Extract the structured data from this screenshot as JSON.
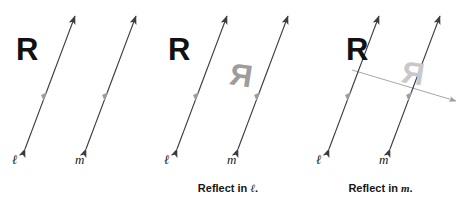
{
  "figure": {
    "background_color": "#ffffff",
    "width": 457,
    "height": 198
  },
  "colors": {
    "line_dark": "#3a3a42",
    "line_gray": "#9d9d9d",
    "glyph_black": "#111111",
    "glyph_gray": "#9d9d9d",
    "glyph_faint": "#c9c9c9",
    "text": "#161616"
  },
  "panels": [
    {
      "id": "panel-1",
      "caption": "",
      "caption_line_label": "",
      "preimage_label": "R",
      "image_label": "",
      "lines": [
        {
          "name": "l",
          "label": "ℓ",
          "style": "double-arrow",
          "color": "#3a3a42",
          "tick": "single-chevron"
        },
        {
          "name": "m",
          "label": "m",
          "style": "double-arrow",
          "color": "#3a3a42",
          "tick": "single-chevron"
        }
      ]
    },
    {
      "id": "panel-2",
      "caption": "Reflect in",
      "caption_line_label": "ℓ",
      "caption_full": "Reflect in ℓ.",
      "preimage_label": "R",
      "image_label": "R",
      "image_style": "mirrored-gray",
      "lines": [
        {
          "name": "l",
          "label": "ℓ",
          "style": "double-arrow",
          "color": "#3a3a42",
          "tick": "single-chevron"
        },
        {
          "name": "m",
          "label": "m",
          "style": "double-arrow",
          "color": "#3a3a42",
          "tick": "single-chevron"
        }
      ]
    },
    {
      "id": "panel-3",
      "caption": "Reflect in",
      "caption_line_label": "m",
      "caption_full": "Reflect in m.",
      "preimage_label": "R",
      "image_label": "R",
      "image_style": "mirrored-faint",
      "extra_line": {
        "name": "reflected-axis",
        "style": "arrow-right",
        "color": "#9d9d9d"
      },
      "lines": [
        {
          "name": "l",
          "label": "ℓ",
          "style": "double-arrow",
          "color": "#3a3a42",
          "tick": "single-chevron"
        },
        {
          "name": "m",
          "label": "m",
          "style": "double-arrow",
          "color": "#3a3a42",
          "tick": "single-chevron"
        }
      ]
    }
  ]
}
